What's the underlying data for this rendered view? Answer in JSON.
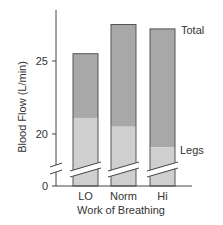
{
  "chart_data": {
    "type": "bar",
    "stacked": true,
    "title": "",
    "xlabel": "Work of Breathing",
    "ylabel": "Blood Flow (L/min)",
    "categories": [
      "LO",
      "Norm",
      "Hi"
    ],
    "series": [
      {
        "name": "Legs",
        "values": [
          21.1,
          20.5,
          19.1
        ],
        "color": "#cfcfcf"
      },
      {
        "name": "Total",
        "values": [
          25.5,
          27.5,
          27.2
        ],
        "color": "#a8a8a8"
      }
    ],
    "yticks": [
      0,
      20,
      25
    ],
    "ylim": [
      0,
      28
    ],
    "axis_break": {
      "between": [
        0,
        20
      ]
    },
    "grid": false,
    "annotations": [
      "Total",
      "Legs"
    ],
    "legend_position": "right (inline labels)"
  },
  "labels": {
    "ylabel": "Blood Flow (L/min)",
    "xlabel": "Work of Breathing",
    "tick_0": "0",
    "tick_20": "20",
    "tick_25": "25",
    "cat_0": "LO",
    "cat_1": "Norm",
    "cat_2": "Hi",
    "total": "Total",
    "legs": "Legs"
  }
}
